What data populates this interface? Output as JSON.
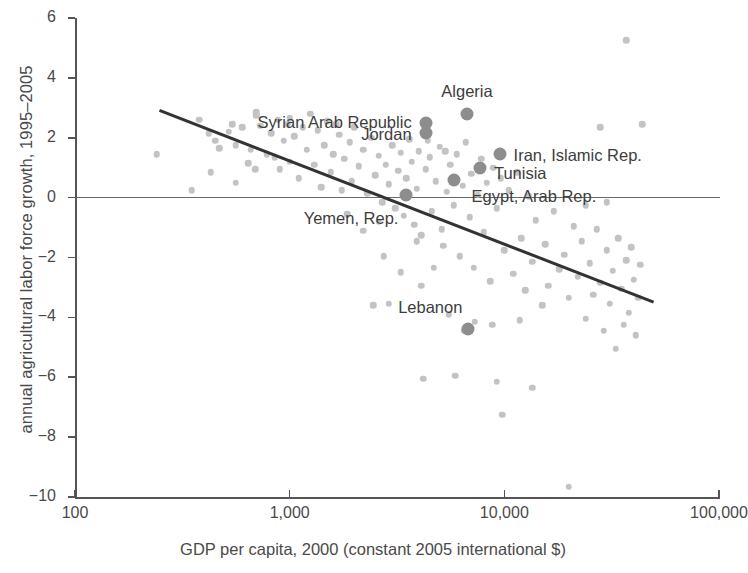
{
  "chart_data": {
    "type": "scatter",
    "title": "",
    "xlabel": "GDP per capita, 2000 (constant 2005 international $)",
    "ylabel": "annual agricultural labor force growth, 1995–2005",
    "xscale": "log",
    "yscale": "linear",
    "xlim": [
      100,
      100000
    ],
    "ylim": [
      -10,
      6
    ],
    "grid": false,
    "legend": false,
    "xticks": [
      "100",
      "1,000",
      "10,000",
      "100,000"
    ],
    "xtick_values": [
      100,
      1000,
      10000,
      100000
    ],
    "yticks": [
      "6",
      "4",
      "2",
      "0",
      "−2",
      "−4",
      "−6",
      "−8",
      "−10"
    ],
    "ytick_values": [
      6,
      4,
      2,
      0,
      -2,
      -4,
      -6,
      -8,
      -10
    ],
    "zero_reference_line": 0,
    "colors": {
      "background": "#ffffff",
      "axis": "#555555",
      "point": "#c3c3c3",
      "highlight_point": "#8d8d8d",
      "trendline": "#333333",
      "text": "#3d3d3d"
    },
    "trendline": {
      "type": "linear_fit_on_log_x",
      "x_start": 250,
      "y_start": 2.95,
      "x_end": 50000,
      "y_end": -3.45
    },
    "highlighted": [
      {
        "name": "Algeria",
        "x": 6700,
        "y": 2.8,
        "label_dx": 0,
        "label_dy": -22,
        "align": "c"
      },
      {
        "name": "Syrian Arab Republic",
        "x": 4300,
        "y": 2.5,
        "label_dx": -14,
        "label_dy": 0,
        "align": "r"
      },
      {
        "name": "Jordan",
        "x": 4300,
        "y": 2.15,
        "label_dx": -14,
        "label_dy": 2,
        "align": "r"
      },
      {
        "name": "Iran, Islamic Rep.",
        "x": 9500,
        "y": 1.45,
        "label_dx": 14,
        "label_dy": 2,
        "align": "l"
      },
      {
        "name": "Tunisia",
        "x": 7700,
        "y": 1.0,
        "label_dx": 14,
        "label_dy": 6,
        "align": "l"
      },
      {
        "name": "Egypt, Arab Rep.",
        "x": 5800,
        "y": 0.6,
        "label_dx": 18,
        "label_dy": 17,
        "align": "l"
      },
      {
        "name": "Yemen, Rep.",
        "x": 3500,
        "y": 0.1,
        "label_dx": -8,
        "label_dy": 24,
        "align": "r"
      },
      {
        "name": "Lebanon",
        "x": 6800,
        "y": -4.4,
        "label_dx": -6,
        "label_dy": -21,
        "align": "r"
      }
    ],
    "points": [
      {
        "x": 240,
        "y": 1.45
      },
      {
        "x": 380,
        "y": 2.6
      },
      {
        "x": 420,
        "y": 2.15
      },
      {
        "x": 450,
        "y": 1.9
      },
      {
        "x": 470,
        "y": 1.65
      },
      {
        "x": 520,
        "y": 2.2
      },
      {
        "x": 540,
        "y": 2.45
      },
      {
        "x": 560,
        "y": 1.75
      },
      {
        "x": 600,
        "y": 2.35
      },
      {
        "x": 640,
        "y": 1.15
      },
      {
        "x": 660,
        "y": 1.6
      },
      {
        "x": 690,
        "y": 0.95
      },
      {
        "x": 700,
        "y": 2.75
      },
      {
        "x": 730,
        "y": 2.4
      },
      {
        "x": 780,
        "y": 1.45
      },
      {
        "x": 820,
        "y": 2.15
      },
      {
        "x": 850,
        "y": 1.35
      },
      {
        "x": 880,
        "y": 2.6
      },
      {
        "x": 900,
        "y": 0.95
      },
      {
        "x": 940,
        "y": 1.9
      },
      {
        "x": 980,
        "y": 2.45
      },
      {
        "x": 1000,
        "y": 1.2
      },
      {
        "x": 1050,
        "y": 2.05
      },
      {
        "x": 1100,
        "y": 0.65
      },
      {
        "x": 1150,
        "y": 2.35
      },
      {
        "x": 1200,
        "y": 1.6
      },
      {
        "x": 1250,
        "y": 2.8
      },
      {
        "x": 1300,
        "y": 1.1
      },
      {
        "x": 1350,
        "y": 2.25
      },
      {
        "x": 1400,
        "y": 0.35
      },
      {
        "x": 1450,
        "y": 1.75
      },
      {
        "x": 1500,
        "y": 2.55
      },
      {
        "x": 1550,
        "y": 0.85
      },
      {
        "x": 1600,
        "y": 1.45
      },
      {
        "x": 1700,
        "y": 2.1
      },
      {
        "x": 1750,
        "y": 0.25
      },
      {
        "x": 1800,
        "y": 1.3
      },
      {
        "x": 1900,
        "y": 1.85
      },
      {
        "x": 1950,
        "y": 0.55
      },
      {
        "x": 2000,
        "y": 2.35
      },
      {
        "x": 2100,
        "y": 1.05
      },
      {
        "x": 2200,
        "y": 1.6
      },
      {
        "x": 2300,
        "y": 0.15
      },
      {
        "x": 2400,
        "y": 2.0
      },
      {
        "x": 2500,
        "y": 0.75
      },
      {
        "x": 2600,
        "y": 1.4
      },
      {
        "x": 2700,
        "y": -0.15
      },
      {
        "x": 2800,
        "y": 1.1
      },
      {
        "x": 2900,
        "y": 0.45
      },
      {
        "x": 3000,
        "y": 1.75
      },
      {
        "x": 3100,
        "y": -0.35
      },
      {
        "x": 3200,
        "y": 0.9
      },
      {
        "x": 3300,
        "y": 1.5
      },
      {
        "x": 3400,
        "y": -0.6
      },
      {
        "x": 3500,
        "y": 0.65
      },
      {
        "x": 3700,
        "y": 1.2
      },
      {
        "x": 3800,
        "y": -0.9
      },
      {
        "x": 3900,
        "y": 0.3
      },
      {
        "x": 4000,
        "y": 1.55
      },
      {
        "x": 4100,
        "y": -1.25
      },
      {
        "x": 4300,
        "y": 0.95
      },
      {
        "x": 4500,
        "y": 1.35
      },
      {
        "x": 4600,
        "y": -0.45
      },
      {
        "x": 4800,
        "y": 0.55
      },
      {
        "x": 5000,
        "y": 1.7
      },
      {
        "x": 5200,
        "y": -1.6
      },
      {
        "x": 5400,
        "y": 0.2
      },
      {
        "x": 5600,
        "y": 1.1
      },
      {
        "x": 5800,
        "y": -0.25
      },
      {
        "x": 6000,
        "y": 1.45
      },
      {
        "x": 6200,
        "y": -1.95
      },
      {
        "x": 6400,
        "y": 0.4
      },
      {
        "x": 6600,
        "y": 1.85
      },
      {
        "x": 6900,
        "y": -0.65
      },
      {
        "x": 7000,
        "y": 0.8
      },
      {
        "x": 7200,
        "y": -2.35
      },
      {
        "x": 7500,
        "y": 0.1
      },
      {
        "x": 7800,
        "y": 1.3
      },
      {
        "x": 8000,
        "y": -1.15
      },
      {
        "x": 8300,
        "y": 0.5
      },
      {
        "x": 8600,
        "y": -2.8
      },
      {
        "x": 8900,
        "y": 1.0
      },
      {
        "x": 9200,
        "y": -0.35
      },
      {
        "x": 9600,
        "y": 0.65
      },
      {
        "x": 10000,
        "y": -1.75
      },
      {
        "x": 10500,
        "y": 0.25
      },
      {
        "x": 11000,
        "y": -2.55
      },
      {
        "x": 11500,
        "y": 0.85
      },
      {
        "x": 12000,
        "y": -1.35
      },
      {
        "x": 12500,
        "y": -3.1
      },
      {
        "x": 13000,
        "y": 0.05
      },
      {
        "x": 13500,
        "y": -2.15
      },
      {
        "x": 14000,
        "y": -0.75
      },
      {
        "x": 15000,
        "y": -3.6
      },
      {
        "x": 15500,
        "y": -1.55
      },
      {
        "x": 16000,
        "y": -2.95
      },
      {
        "x": 17000,
        "y": -0.45
      },
      {
        "x": 18000,
        "y": -2.4
      },
      {
        "x": 19000,
        "y": -1.9
      },
      {
        "x": 20000,
        "y": -3.35
      },
      {
        "x": 21000,
        "y": -0.95
      },
      {
        "x": 22000,
        "y": -2.65
      },
      {
        "x": 23000,
        "y": -1.45
      },
      {
        "x": 24000,
        "y": -4.05
      },
      {
        "x": 25000,
        "y": -2.2
      },
      {
        "x": 26000,
        "y": -3.25
      },
      {
        "x": 27000,
        "y": -1.05
      },
      {
        "x": 28000,
        "y": -2.85
      },
      {
        "x": 29000,
        "y": -4.45
      },
      {
        "x": 30000,
        "y": -1.75
      },
      {
        "x": 31000,
        "y": -3.55
      },
      {
        "x": 32000,
        "y": -2.45
      },
      {
        "x": 33000,
        "y": -5.05
      },
      {
        "x": 34000,
        "y": -1.35
      },
      {
        "x": 35000,
        "y": -3.05
      },
      {
        "x": 36000,
        "y": -4.25
      },
      {
        "x": 37000,
        "y": -2.1
      },
      {
        "x": 38000,
        "y": -3.85
      },
      {
        "x": 39000,
        "y": -1.65
      },
      {
        "x": 40000,
        "y": -2.75
      },
      {
        "x": 41000,
        "y": -4.6
      },
      {
        "x": 42000,
        "y": -3.35
      },
      {
        "x": 43000,
        "y": -2.25
      },
      {
        "x": 44000,
        "y": 2.45
      },
      {
        "x": 37000,
        "y": 5.25
      },
      {
        "x": 24000,
        "y": -0.25
      },
      {
        "x": 30000,
        "y": -0.15
      },
      {
        "x": 5500,
        "y": -3.9
      },
      {
        "x": 6500,
        "y": -4.45
      },
      {
        "x": 7300,
        "y": -4.15
      },
      {
        "x": 8800,
        "y": -4.25
      },
      {
        "x": 11800,
        "y": -4.1
      },
      {
        "x": 5900,
        "y": -5.95
      },
      {
        "x": 9200,
        "y": -6.15
      },
      {
        "x": 4200,
        "y": -6.05
      },
      {
        "x": 9800,
        "y": -7.25
      },
      {
        "x": 13500,
        "y": -6.35
      },
      {
        "x": 2450,
        "y": -3.6
      },
      {
        "x": 2900,
        "y": -3.55
      },
      {
        "x": 4100,
        "y": -2.95
      },
      {
        "x": 3300,
        "y": -2.5
      },
      {
        "x": 2750,
        "y": -1.95
      },
      {
        "x": 3900,
        "y": -1.45
      },
      {
        "x": 1850,
        "y": -0.55
      },
      {
        "x": 2200,
        "y": -1.1
      },
      {
        "x": 4700,
        "y": -2.35
      },
      {
        "x": 5100,
        "y": -1.05
      },
      {
        "x": 20000,
        "y": -9.65
      },
      {
        "x": 28000,
        "y": 2.35
      },
      {
        "x": 2600,
        "y": -0.8
      },
      {
        "x": 700,
        "y": 2.85
      },
      {
        "x": 1000,
        "y": 2.65
      },
      {
        "x": 1650,
        "y": 2.45
      },
      {
        "x": 3600,
        "y": 1.95
      },
      {
        "x": 4400,
        "y": 1.9
      },
      {
        "x": 5300,
        "y": 1.55
      },
      {
        "x": 430,
        "y": 0.85
      },
      {
        "x": 560,
        "y": 0.5
      },
      {
        "x": 350,
        "y": 0.25
      }
    ]
  }
}
